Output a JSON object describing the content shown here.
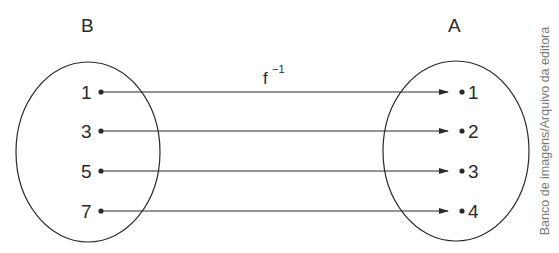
{
  "diagram": {
    "type": "function-mapping",
    "function_label": "f",
    "function_superscript": "−1",
    "domain_set": {
      "name": "B",
      "elements": [
        "1",
        "3",
        "5",
        "7"
      ]
    },
    "codomain_set": {
      "name": "A",
      "elements": [
        "1",
        "2",
        "3",
        "4"
      ]
    },
    "mappings": [
      {
        "from": "1",
        "to": "1"
      },
      {
        "from": "3",
        "to": "2"
      },
      {
        "from": "5",
        "to": "3"
      },
      {
        "from": "7",
        "to": "4"
      }
    ],
    "credit": "Banco de imagens/Arquivo da editora"
  },
  "colors": {
    "stroke": "#2a2a2a",
    "text": "#2a2a2a",
    "credit": "#7a7a7a",
    "background": "#ffffff"
  }
}
